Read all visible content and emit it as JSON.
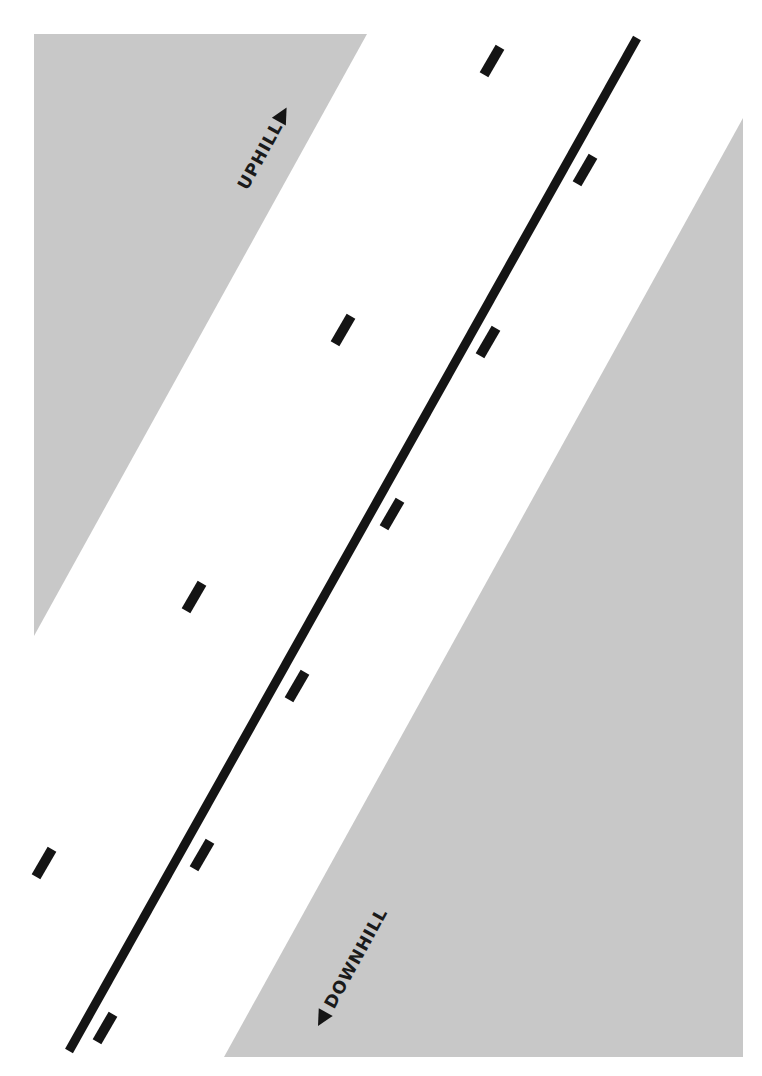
{
  "diagram": {
    "labels": {
      "uphill": "UPHILL",
      "downhill": "DOWNHILL"
    },
    "colors": {
      "background": "#ffffff",
      "slope_fill": "#c8c8c8",
      "line": "#141414"
    },
    "arrows": {
      "uphill": "triangle-up-right",
      "downhill": "triangle-down-left"
    }
  }
}
